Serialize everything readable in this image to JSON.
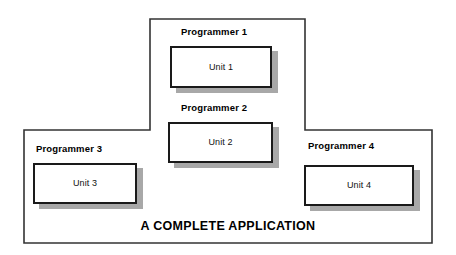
{
  "diagram": {
    "title": "A COMPLETE APPLICATION",
    "shape": "inverted-t-outline",
    "outline_color": "#333333",
    "box_border_color": "#1a1a1a",
    "shadow_color": "#a8a8a8",
    "background_color": "#ffffff",
    "nodes": [
      {
        "id": "programmer-1",
        "caption": "Programmer 1",
        "unit": "Unit 1"
      },
      {
        "id": "programmer-2",
        "caption": "Programmer 2",
        "unit": "Unit 2"
      },
      {
        "id": "programmer-3",
        "caption": "Programmer 3",
        "unit": "Unit 3"
      },
      {
        "id": "programmer-4",
        "caption": "Programmer 4",
        "unit": "Unit 4"
      }
    ]
  }
}
